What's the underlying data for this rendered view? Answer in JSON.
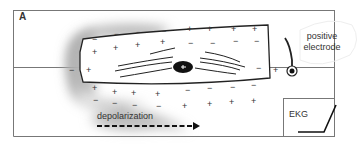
{
  "panel_label": "A",
  "electrode": {
    "label_line1": "positive",
    "label_line2": "electrode"
  },
  "depolarization_label": "depolarization",
  "ekg_label": "EKG",
  "signs": {
    "plus": "+",
    "minus": "−"
  }
}
